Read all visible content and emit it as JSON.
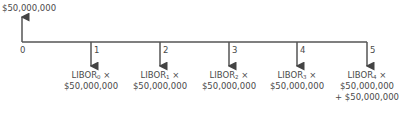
{
  "diagram": {
    "type": "cash-flow-timeline",
    "inflow": {
      "period": "0",
      "amount": "$50,000,000"
    },
    "periods": [
      {
        "label": "0"
      },
      {
        "label": "1",
        "line1_prefix": "LIBOR",
        "sub": "0",
        "line1_suffix": " ×",
        "line2": "$50,000,000"
      },
      {
        "label": "2",
        "line1_prefix": "LIBOR",
        "sub": "1",
        "line1_suffix": " ×",
        "line2": "$50,000,000"
      },
      {
        "label": "3",
        "line1_prefix": "LIBOR",
        "sub": "2",
        "line1_suffix": " ×",
        "line2": "$50,000,000"
      },
      {
        "label": "4",
        "line1_prefix": "LIBOR",
        "sub": "3",
        "line1_suffix": " ×",
        "line2": "$50,000,000"
      },
      {
        "label": "5",
        "line1_prefix": "LIBOR",
        "sub": "4",
        "line1_suffix": " ×",
        "line2": "$50,000,000",
        "line3": "+ $50,000,000"
      }
    ],
    "line_color": "#555555"
  }
}
